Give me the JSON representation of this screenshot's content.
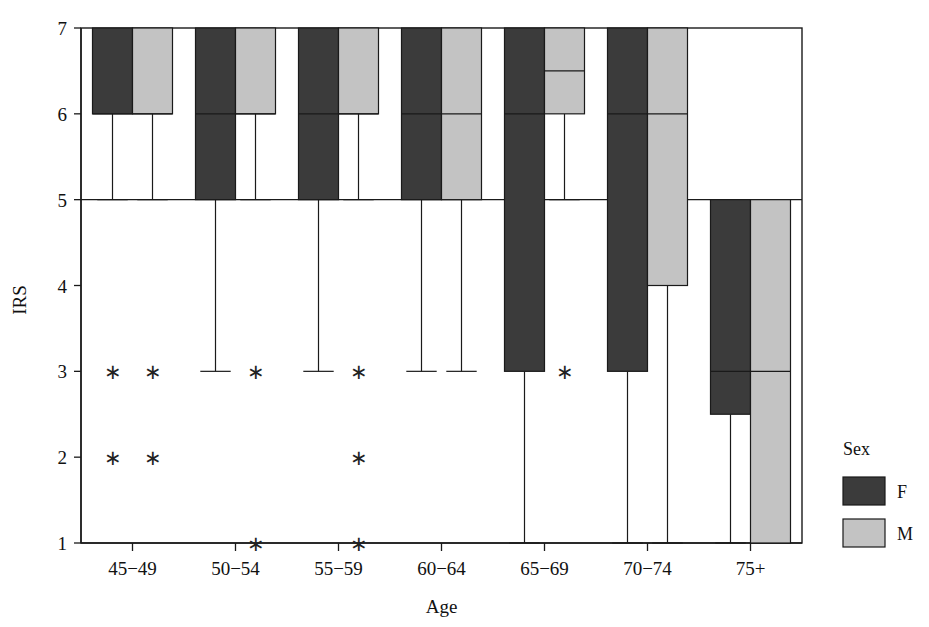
{
  "chart_data": {
    "type": "box",
    "title": "",
    "xlabel": "Age",
    "ylabel": "IRS",
    "ylim": [
      1,
      7
    ],
    "yticks": [
      1,
      2,
      3,
      4,
      5,
      6,
      7
    ],
    "ytick_labels": [
      "1",
      "2",
      "3",
      "4",
      "5",
      "6",
      "7"
    ],
    "grid": false,
    "categories": [
      "45−49",
      "50−54",
      "55−59",
      "60−64",
      "65−69",
      "70−74",
      "75+"
    ],
    "legend": {
      "title": "Sex",
      "position": "right",
      "entries": [
        {
          "name": "F",
          "color": "#3b3b3b"
        },
        {
          "name": "M",
          "color": "#c3c3c3"
        }
      ]
    },
    "series": [
      {
        "name": "F",
        "color": "#3b3b3b",
        "boxes": [
          {
            "category": "45−49",
            "whisker_low": 5,
            "q1": 6,
            "median": 6,
            "q3": 7,
            "whisker_high": 7,
            "outliers": [
              3,
              2
            ]
          },
          {
            "category": "50−54",
            "whisker_low": 3,
            "q1": 5,
            "median": 6,
            "q3": 7,
            "whisker_high": 7,
            "outliers": []
          },
          {
            "category": "55−59",
            "whisker_low": 3,
            "q1": 5,
            "median": 6,
            "q3": 7,
            "whisker_high": 7,
            "outliers": []
          },
          {
            "category": "60−64",
            "whisker_low": 3,
            "q1": 5,
            "median": 6,
            "q3": 7,
            "whisker_high": 7,
            "outliers": []
          },
          {
            "category": "65−69",
            "whisker_low": 1,
            "q1": 3,
            "median": 6,
            "q3": 7,
            "whisker_high": 7,
            "outliers": []
          },
          {
            "category": "70−74",
            "whisker_low": 1,
            "q1": 3,
            "median": 6,
            "q3": 7,
            "whisker_high": 7,
            "outliers": []
          },
          {
            "category": "75+",
            "whisker_low": 1,
            "q1": 2.5,
            "median": 3,
            "q3": 5,
            "whisker_high": 5,
            "outliers": []
          }
        ]
      },
      {
        "name": "M",
        "color": "#c3c3c3",
        "boxes": [
          {
            "category": "45−49",
            "whisker_low": 5,
            "q1": 6,
            "median": 6,
            "q3": 7,
            "whisker_high": 7,
            "outliers": [
              3,
              2
            ]
          },
          {
            "category": "50−54",
            "whisker_low": 5,
            "q1": 6,
            "median": 6,
            "q3": 7,
            "whisker_high": 7,
            "outliers": [
              3,
              1
            ]
          },
          {
            "category": "55−59",
            "whisker_low": 5,
            "q1": 6,
            "median": 6,
            "q3": 7,
            "whisker_high": 7,
            "outliers": [
              3,
              2,
              1
            ]
          },
          {
            "category": "60−64",
            "whisker_low": 3,
            "q1": 5,
            "median": 6,
            "q3": 7,
            "whisker_high": 7,
            "outliers": []
          },
          {
            "category": "65−69",
            "whisker_low": 5,
            "q1": 6,
            "median": 6.5,
            "q3": 7,
            "whisker_high": 7,
            "outliers": [
              3
            ]
          },
          {
            "category": "70−74",
            "whisker_low": 1,
            "q1": 4,
            "median": 6,
            "q3": 7,
            "whisker_high": 7,
            "outliers": []
          },
          {
            "category": "75+",
            "whisker_low": 1,
            "q1": 1,
            "median": 3,
            "q3": 5,
            "whisker_high": 5,
            "outliers": []
          }
        ]
      }
    ]
  },
  "axes": {
    "y_title": "IRS",
    "x_title": "Age"
  }
}
